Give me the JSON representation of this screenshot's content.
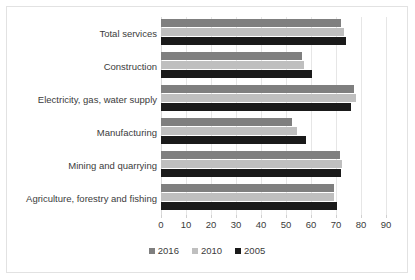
{
  "chart_data": {
    "type": "bar",
    "orientation": "horizontal",
    "title": "",
    "subtitle": "",
    "xlabel": "",
    "ylabel": "",
    "xlim": [
      0,
      90
    ],
    "xticks": [
      0,
      10,
      20,
      30,
      40,
      50,
      60,
      70,
      80,
      90
    ],
    "xtick_labels": [
      "0",
      "10",
      "20",
      "30",
      "40",
      "50",
      "60",
      "70",
      "80",
      "90"
    ],
    "grid": true,
    "grid_axis": "x",
    "legend_position": "bottom",
    "categories": [
      "Agriculture, forestry and fishing",
      "Mining and quarrying",
      "Manufacturing",
      "Electricity, gas, water supply",
      "Construction",
      "Total services"
    ],
    "series": [
      {
        "name": "2016",
        "color": "#7f7f7f",
        "values": [
          69,
          71.5,
          52.5,
          77,
          56.5,
          72
        ]
      },
      {
        "name": "2010",
        "color": "#bfbfbf",
        "values": [
          69,
          72.5,
          54.5,
          78,
          57,
          73
        ]
      },
      {
        "name": "2005",
        "color": "#1a1a1a",
        "values": [
          70.5,
          72,
          58,
          76,
          60.5,
          74
        ]
      }
    ]
  },
  "legend": {
    "items": [
      {
        "label": "2016",
        "color": "#7f7f7f"
      },
      {
        "label": "2010",
        "color": "#bfbfbf"
      },
      {
        "label": "2005",
        "color": "#1a1a1a"
      }
    ]
  },
  "colors": {
    "background": "#ffffff",
    "border": "#e2e2e2",
    "gridline": "#e6e6e6",
    "text": "#3b3b3b",
    "series_2016": "#7f7f7f",
    "series_2010": "#bfbfbf",
    "series_2005": "#1a1a1a"
  }
}
